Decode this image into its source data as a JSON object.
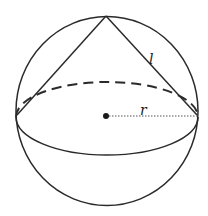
{
  "diagram": {
    "labels": {
      "slant": "l",
      "radius": "r"
    },
    "colors": {
      "stroke": "#2a2a2a",
      "background": "#ffffff"
    }
  }
}
